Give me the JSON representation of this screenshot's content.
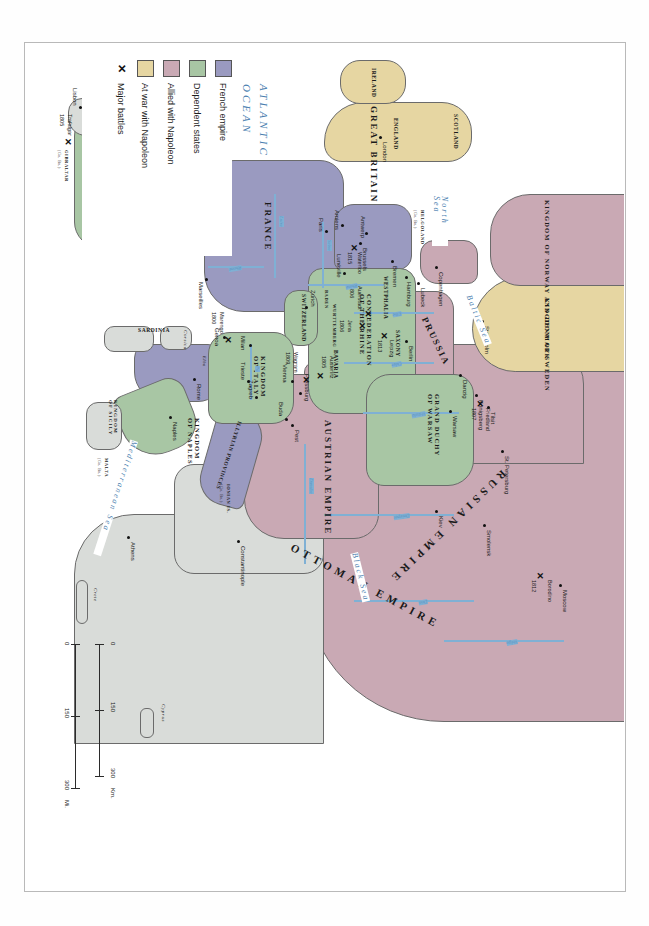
{
  "map": {
    "title": "Napoleonic Europe",
    "projection_note": "landscape map printed rotated on a portrait page",
    "legend": {
      "items": [
        {
          "label": "French empire",
          "symbol": "swatch",
          "color": "#9a9ac0"
        },
        {
          "label": "Dependent states",
          "symbol": "swatch",
          "color": "#a8c6a4"
        },
        {
          "label": "Allied with Napoleon",
          "symbol": "swatch",
          "color": "#c9a9b4"
        },
        {
          "label": "At war with Napoleon",
          "symbol": "swatch",
          "color": "#e6d6a2"
        },
        {
          "label": "Major battles",
          "symbol": "x",
          "color": "#111111"
        }
      ]
    },
    "scale": {
      "km": {
        "ticks": [
          "0",
          "150",
          "300"
        ],
        "unit": "Km."
      },
      "mi": {
        "ticks": [
          "0",
          "150",
          "300"
        ],
        "unit": "Mi."
      }
    },
    "polities": [
      {
        "name": "RUSSIAN EMPIRE",
        "class": "allied"
      },
      {
        "name": "OTTOMAN EMPIRE",
        "class": "neutral"
      },
      {
        "name": "AUSTRIAN EMPIRE",
        "class": "allied"
      },
      {
        "name": "PRUSSIA",
        "class": "allied"
      },
      {
        "name": "KINGDOM OF SWEDEN",
        "class": "atwar"
      },
      {
        "name": "KINGDOM OF NORWAY AND DENMARK",
        "class": "allied"
      },
      {
        "name": "GREAT BRITAIN",
        "class": "atwar"
      },
      {
        "name": "FRANCE",
        "class": "french"
      },
      {
        "name": "SPAIN",
        "class": "dependent"
      },
      {
        "name": "PORTUGAL",
        "class": "neutral"
      },
      {
        "name": "GRAND DUCHY OF WARSAW",
        "class": "dependent"
      },
      {
        "name": "CONFEDERATION OF THE RHINE",
        "class": "dependent"
      },
      {
        "name": "KINGDOM OF ITALY",
        "class": "dependent"
      },
      {
        "name": "KINGDOM OF NAPLES",
        "class": "dependent"
      },
      {
        "name": "KINGDOM OF SICILY",
        "class": "neutral"
      },
      {
        "name": "SWITZERLAND",
        "class": "dependent"
      },
      {
        "name": "ILLYRIAN PROVINCES",
        "class": "french"
      },
      {
        "name": "SARDINIA",
        "class": "neutral"
      }
    ],
    "provinces": [
      "SCOTLAND",
      "ENGLAND",
      "IRELAND",
      "WESTPHALIA",
      "SAXONY",
      "BAVARIA",
      "WURTTEMBERG",
      "BADEN"
    ],
    "dependencies": [
      {
        "name": "HELGOLAND",
        "note": "(Gr. Br.)"
      },
      {
        "name": "GIBRALTAR",
        "note": "(Gr. Br.)"
      },
      {
        "name": "MALTA",
        "note": "(Gr. Br.)"
      },
      {
        "name": "IONIAN IS.",
        "note": "(Gr. Br.)"
      }
    ],
    "cities": [
      "Moscow",
      "St. Petersburg",
      "Smolensk",
      "Kiev",
      "Stockholm",
      "Copenhagen",
      "Lubeck",
      "Hamburg",
      "Bremen",
      "Berlin",
      "Danzig",
      "Konigsberg",
      "Tilsit",
      "Warsaw",
      "Pest",
      "Buda",
      "Pressburg",
      "Vienna",
      "Zagreb",
      "Trieste",
      "Zurich",
      "Milan",
      "Genoa",
      "Rome",
      "Naples",
      "Marseilles",
      "Lunéville",
      "Paris",
      "Amiens",
      "Antwerp",
      "Brussels",
      "Madrid",
      "Lisbon",
      "London",
      "Constantinople",
      "Athens"
    ],
    "battles": [
      {
        "name": "Borodino",
        "year": "1812"
      },
      {
        "name": "Friedland",
        "year": "1807"
      },
      {
        "name": "Leipzig",
        "year": "1813"
      },
      {
        "name": "Auerstadt",
        "year": "1806"
      },
      {
        "name": "Jena",
        "year": "1806"
      },
      {
        "name": "Austerlitz",
        "year": "1805"
      },
      {
        "name": "Wagram",
        "year": "1809"
      },
      {
        "name": "Marengo",
        "year": "1800"
      },
      {
        "name": "Waterloo",
        "year": "1815"
      },
      {
        "name": "Trafalgar",
        "year": "1805"
      }
    ],
    "waters": [
      {
        "name": "ATLANTIC OCEAN",
        "size": "ocean"
      },
      {
        "name": "North Sea",
        "size": "sea"
      },
      {
        "name": "Baltic Sea",
        "size": "sea"
      },
      {
        "name": "Black Sea",
        "size": "sea"
      },
      {
        "name": "Mediterranean Sea",
        "size": "sea"
      }
    ],
    "rivers": [
      "Volga",
      "Dnieper",
      "Danube",
      "Don",
      "Oder",
      "Elbe",
      "Vistula",
      "Rhine",
      "Seine",
      "Loire",
      "Rhone",
      "Ebro",
      "Tagus",
      "Po"
    ],
    "islands": [
      "Corsica",
      "Sardinia",
      "Elba",
      "Crete",
      "Cyprus"
    ]
  }
}
